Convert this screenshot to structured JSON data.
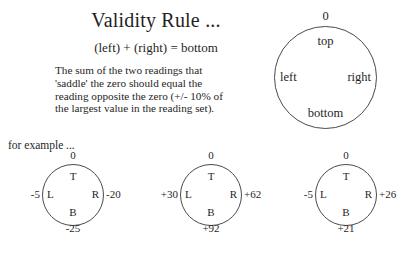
{
  "slide": {
    "title": "Validity Rule ...",
    "formula": "(left) + (right) = bottom",
    "body_lines": [
      "The sum of the two readings that",
      "'saddle' the zero should equal the",
      "reading opposite the zero (+/- 10% of",
      "the largest value in the reading set).",
      ""
    ],
    "for_example": "for example ...",
    "text_color": "#262626",
    "line_color": "#4a4a4a",
    "background": "#ffffff"
  },
  "reference_circle": {
    "zero": "0",
    "top": "top",
    "left": "left",
    "right": "right",
    "bottom": "bottom"
  },
  "examples": [
    {
      "zero": "0",
      "top_letter": "T",
      "left_letter": "L",
      "right_letter": "R",
      "bottom_letter": "B",
      "left_value": "-5",
      "right_value": "-20",
      "bottom_value": "-25"
    },
    {
      "zero": "0",
      "top_letter": "T",
      "left_letter": "L",
      "right_letter": "R",
      "bottom_letter": "B",
      "left_value": "+30",
      "right_value": "+62",
      "bottom_value": "+92"
    },
    {
      "zero": "0",
      "top_letter": "T",
      "left_letter": "L",
      "right_letter": "R",
      "bottom_letter": "B",
      "left_value": "-5",
      "right_value": "+26",
      "bottom_value": "+21"
    }
  ]
}
